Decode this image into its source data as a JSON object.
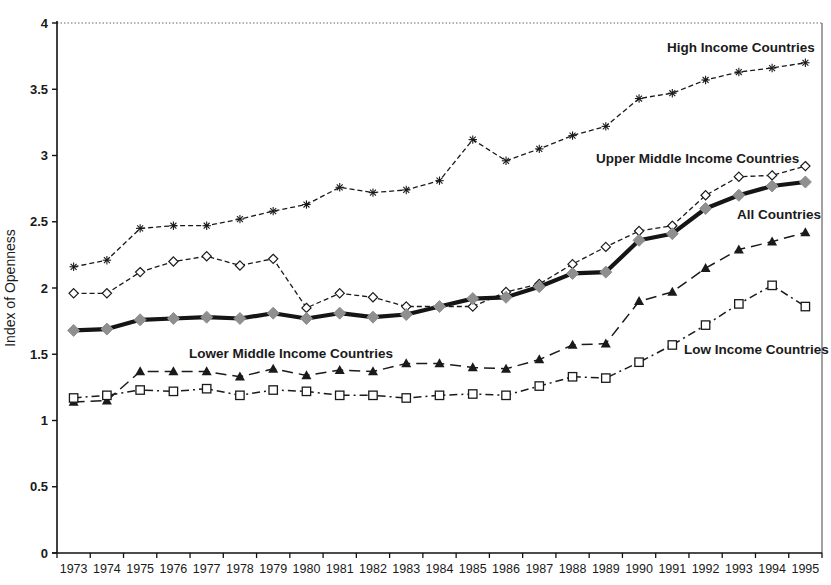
{
  "figure": {
    "ylabel": "Index of Openness"
  },
  "chart_data": {
    "type": "line",
    "title": "",
    "xlabel": "",
    "ylabel": "Index of Openness",
    "ylim": [
      0,
      4
    ],
    "yticks": [
      0,
      0.5,
      1,
      1.5,
      2,
      2.5,
      3,
      3.5,
      4
    ],
    "grid": "off (single fine-dotted rule at y=4 top border, solid right border)",
    "legend": "inline annotations next to lines",
    "x": [
      "1973",
      "1974",
      "1975",
      "1976",
      "1977",
      "1978",
      "1979",
      "1980",
      "1981",
      "1982",
      "1983",
      "1984",
      "1985",
      "1986",
      "1987",
      "1988",
      "1989",
      "1990",
      "1991",
      "1992",
      "1993",
      "1994",
      "1995"
    ],
    "series": [
      {
        "name": "High Income Countries",
        "marker": "asterisk",
        "line": "dashed",
        "color": "#1a1a1a",
        "values": [
          2.16,
          2.21,
          2.45,
          2.47,
          2.47,
          2.52,
          2.58,
          2.63,
          2.76,
          2.72,
          2.74,
          2.81,
          3.12,
          2.96,
          3.05,
          3.15,
          3.22,
          3.43,
          3.47,
          3.57,
          3.63,
          3.66,
          3.7
        ]
      },
      {
        "name": "Upper Middle Income Countries",
        "marker": "open-diamond",
        "line": "dashed",
        "color": "#1a1a1a",
        "values": [
          1.96,
          1.96,
          2.12,
          2.2,
          2.24,
          2.17,
          2.22,
          1.85,
          1.96,
          1.93,
          1.86,
          1.86,
          1.86,
          1.97,
          2.03,
          2.18,
          2.31,
          2.43,
          2.47,
          2.7,
          2.84,
          2.85,
          2.92
        ]
      },
      {
        "name": "Lower Middle Income Countries",
        "marker": "filled-triangle",
        "line": "long-dash",
        "color": "#1a1a1a",
        "values": [
          1.14,
          1.15,
          1.37,
          1.37,
          1.37,
          1.33,
          1.39,
          1.34,
          1.38,
          1.37,
          1.43,
          1.43,
          1.4,
          1.39,
          1.46,
          1.57,
          1.58,
          1.9,
          1.97,
          2.15,
          2.29,
          2.35,
          2.42
        ]
      },
      {
        "name": "Low Income Countries",
        "marker": "open-square",
        "line": "dash-dot",
        "color": "#1a1a1a",
        "values": [
          1.17,
          1.19,
          1.23,
          1.22,
          1.24,
          1.19,
          1.23,
          1.22,
          1.19,
          1.19,
          1.17,
          1.19,
          1.2,
          1.19,
          1.26,
          1.33,
          1.32,
          1.44,
          1.57,
          1.72,
          1.88,
          2.02,
          1.86
        ]
      },
      {
        "name": "All Countries",
        "marker": "filled-diamond",
        "line": "solid-thick",
        "color": "#151515",
        "marker_color": "#8f8f8f",
        "values": [
          1.68,
          1.69,
          1.76,
          1.77,
          1.78,
          1.77,
          1.81,
          1.77,
          1.81,
          1.78,
          1.8,
          1.86,
          1.92,
          1.93,
          2.01,
          2.11,
          2.12,
          2.36,
          2.41,
          2.6,
          2.7,
          2.77,
          2.8
        ]
      }
    ],
    "annotations": [
      {
        "text": "High Income Countries",
        "x": 667,
        "y": 52
      },
      {
        "text": "Upper Middle Income Countries",
        "x": 596,
        "y": 163
      },
      {
        "text": "All Countries",
        "x": 737,
        "y": 219
      },
      {
        "text": "Lower Middle Income Countries",
        "x": 189,
        "y": 358
      },
      {
        "text": "Low Income Countries",
        "x": 684,
        "y": 354
      }
    ]
  }
}
